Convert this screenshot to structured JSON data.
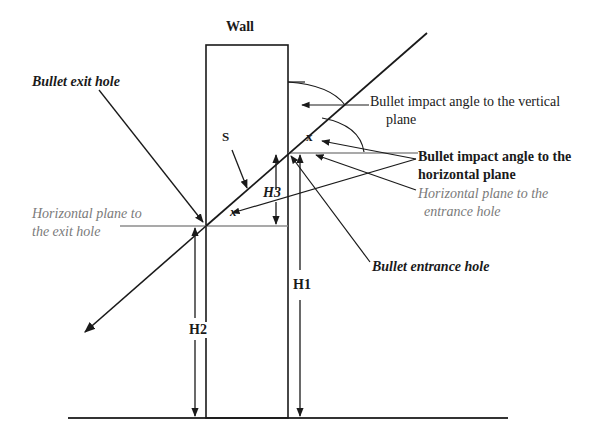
{
  "title": "Wall",
  "colors": {
    "line": "#1a1a1a",
    "plane_line": "#8c8c8c",
    "grey_text": "#7a7a7a"
  },
  "labels": {
    "wall": "Wall",
    "exit_hole": "Bullet exit hole",
    "s_label": "S",
    "h1": "H1",
    "h2": "H2",
    "h3": "H3",
    "x_top": "x",
    "x_bottom": "x",
    "vertical_angle_line1": "Bullet impact angle to the vertical",
    "vertical_angle_line2": "plane",
    "horizontal_angle_line1": "Bullet impact angle to the",
    "horizontal_angle_line2": "horizontal plane",
    "entrance_plane_line1": "Horizontal plane to the",
    "entrance_plane_line2": "entrance hole",
    "exit_plane_line1": "Horizontal plane to",
    "exit_plane_line2": "the exit hole",
    "entrance_hole": "Bullet entrance hole"
  },
  "geometry": {
    "wall": {
      "x1": 206,
      "x2": 288,
      "top": 45,
      "bottom": 418
    },
    "ground": {
      "x1": 68,
      "x2": 508,
      "y": 418
    },
    "trajectory": {
      "start": [
        85,
        332
      ],
      "end": [
        427,
        33
      ]
    },
    "entrance_point": [
      288,
      152
    ],
    "exit_point": [
      206,
      226
    ]
  }
}
